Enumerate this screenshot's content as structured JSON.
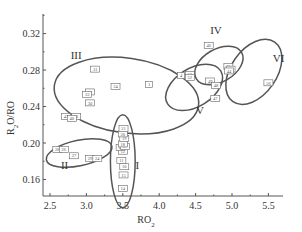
{
  "chart_data": {
    "type": "scatter",
    "title": "",
    "xlabel": "RO2",
    "ylabel": "R2O/RO",
    "xlim": [
      2.4,
      5.7
    ],
    "ylim": [
      0.14,
      0.34
    ],
    "xticks": [
      "2.5",
      "3.0",
      "3.5",
      "4.0",
      "4.5",
      "5.0",
      "5.5"
    ],
    "yticks": [
      "0.16",
      "0.20",
      "0.24",
      "0.28",
      "0.32"
    ],
    "grid": false,
    "legend": null,
    "groups": [
      {
        "name": "I",
        "label_x": 3.7,
        "label_y": 0.172,
        "ellipse": {
          "cx": 3.5,
          "cy": 0.18,
          "rx": 0.17,
          "ry": 0.051,
          "rotate": 0
        }
      },
      {
        "name": "II",
        "label_x": 2.7,
        "label_y": 0.172,
        "ellipse": {
          "cx": 2.9,
          "cy": 0.189,
          "rx": 0.46,
          "ry": 0.014,
          "rotate": 12
        }
      },
      {
        "name": "III",
        "label_x": 2.86,
        "label_y": 0.292,
        "ellipse": {
          "cx": 3.55,
          "cy": 0.252,
          "rx": 1.0,
          "ry": 0.041,
          "rotate": -8
        }
      },
      {
        "name": "IV",
        "label_x": 4.78,
        "label_y": 0.32,
        "ellipse": {
          "cx": 4.82,
          "cy": 0.285,
          "rx": 0.36,
          "ry": 0.018,
          "rotate": 30
        }
      },
      {
        "name": "V",
        "label_x": 4.56,
        "label_y": 0.232,
        "ellipse": {
          "cx": 4.48,
          "cy": 0.261,
          "rx": 0.43,
          "ry": 0.021,
          "rotate": 32
        }
      },
      {
        "name": "VI",
        "label_x": 5.64,
        "label_y": 0.289,
        "ellipse": {
          "cx": 5.3,
          "cy": 0.278,
          "rx": 0.5,
          "ry": 0.025,
          "rotate": 55
        }
      }
    ],
    "points": [
      {
        "label": "14",
        "x": 3.5,
        "y": 0.15,
        "group": "I"
      },
      {
        "label": "15",
        "x": 3.51,
        "y": 0.165,
        "group": "I"
      },
      {
        "label": "10",
        "x": 3.52,
        "y": 0.174,
        "group": "I"
      },
      {
        "label": "11",
        "x": 3.48,
        "y": 0.181,
        "group": "I"
      },
      {
        "label": "12",
        "x": 3.5,
        "y": 0.191,
        "group": "I"
      },
      {
        "label": "13",
        "x": 3.47,
        "y": 0.195,
        "group": "I"
      },
      {
        "label": "17",
        "x": 3.53,
        "y": 0.196,
        "group": "I"
      },
      {
        "label": "18",
        "x": 3.5,
        "y": 0.199,
        "group": "I"
      },
      {
        "label": "19",
        "x": 3.52,
        "y": 0.205,
        "group": "I"
      },
      {
        "label": "20",
        "x": 3.5,
        "y": 0.21,
        "group": "I"
      },
      {
        "label": "21",
        "x": 3.51,
        "y": 0.216,
        "group": "I"
      },
      {
        "label": "28",
        "x": 2.6,
        "y": 0.193,
        "group": "II"
      },
      {
        "label": "26",
        "x": 2.69,
        "y": 0.193,
        "group": "II"
      },
      {
        "label": "27",
        "x": 2.83,
        "y": 0.186,
        "group": "II"
      },
      {
        "label": "29",
        "x": 3.05,
        "y": 0.183,
        "group": "II"
      },
      {
        "label": "24",
        "x": 3.15,
        "y": 0.183,
        "group": "II"
      },
      {
        "label": "31",
        "x": 3.12,
        "y": 0.281,
        "group": "III"
      },
      {
        "label": "34",
        "x": 3.4,
        "y": 0.262,
        "group": "III"
      },
      {
        "label": "32",
        "x": 3.05,
        "y": 0.256,
        "group": "III"
      },
      {
        "label": "33",
        "x": 3.01,
        "y": 0.253,
        "group": "III"
      },
      {
        "label": "30",
        "x": 3.05,
        "y": 0.244,
        "group": "III"
      },
      {
        "label": "42",
        "x": 2.72,
        "y": 0.229,
        "group": "III"
      },
      {
        "label": "41",
        "x": 2.86,
        "y": 0.229,
        "group": "III"
      },
      {
        "label": "40",
        "x": 2.8,
        "y": 0.227,
        "group": "III"
      },
      {
        "label": "1",
        "x": 3.86,
        "y": 0.264,
        "group": "III"
      },
      {
        "label": "46",
        "x": 4.68,
        "y": 0.307,
        "group": "IV"
      },
      {
        "label": "45",
        "x": 4.95,
        "y": 0.284,
        "group": "IV"
      },
      {
        "label": "43",
        "x": 4.98,
        "y": 0.281,
        "group": "IV"
      },
      {
        "label": "44",
        "x": 4.96,
        "y": 0.279,
        "group": "IV"
      },
      {
        "label": "4",
        "x": 4.3,
        "y": 0.274,
        "group": "V"
      },
      {
        "label": "53",
        "x": 4.42,
        "y": 0.275,
        "group": "V"
      },
      {
        "label": "52",
        "x": 4.42,
        "y": 0.272,
        "group": "V"
      },
      {
        "label": "49",
        "x": 4.7,
        "y": 0.268,
        "group": "V"
      },
      {
        "label": "48",
        "x": 4.78,
        "y": 0.263,
        "group": "V"
      },
      {
        "label": "47",
        "x": 4.77,
        "y": 0.249,
        "group": "V"
      },
      {
        "label": "56",
        "x": 5.5,
        "y": 0.266,
        "group": "VI"
      }
    ]
  }
}
